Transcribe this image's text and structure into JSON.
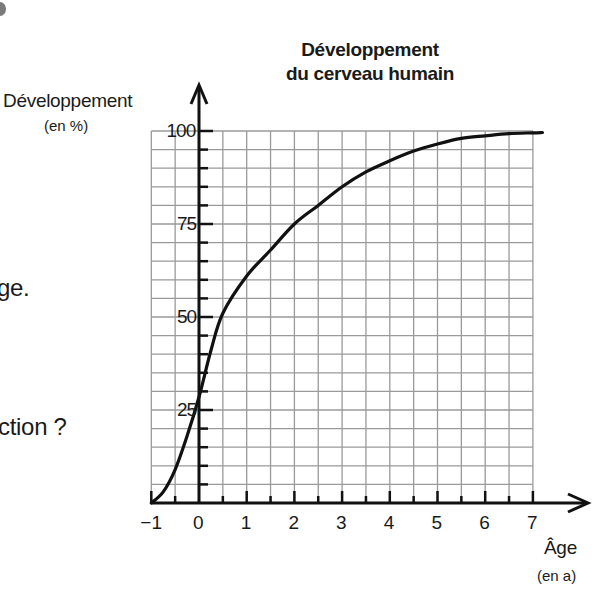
{
  "page": {
    "fragments": [
      "ge.",
      "ction ?"
    ]
  },
  "chart_data": {
    "type": "line",
    "title": "Développement du cerveau humain",
    "title_lines": [
      "Développement",
      "du cerveau humain"
    ],
    "xlabel": "Âge",
    "xunit": "(en a)",
    "ylabel": "Développement",
    "yunit": "(en %)",
    "xlim": [
      -1,
      7
    ],
    "ylim": [
      0,
      100
    ],
    "x_ticks": [
      "-1",
      "0",
      "1",
      "2",
      "3",
      "4",
      "5",
      "6",
      "7"
    ],
    "y_ticks": [
      "25",
      "50",
      "75",
      "100"
    ],
    "grid": true,
    "grid_step_x": 0.5,
    "grid_step_y": 5,
    "legend": "none",
    "series": [
      {
        "name": "Développement du cerveau",
        "x": [
          -1,
          -0.75,
          -0.5,
          -0.25,
          0,
          0.25,
          0.5,
          1,
          1.5,
          2,
          2.5,
          3,
          3.5,
          4,
          4.5,
          5,
          5.5,
          6,
          6.5,
          7,
          7.2
        ],
        "y": [
          0,
          3,
          9,
          18,
          28.5,
          41,
          51,
          61,
          68,
          75,
          80,
          85,
          89,
          92,
          94.6,
          96.5,
          98,
          98.7,
          99.3,
          99.5,
          99.6
        ]
      }
    ]
  },
  "colors": {
    "axis": "#111111",
    "grid": "#9a9a9a",
    "curve": "#111111"
  }
}
